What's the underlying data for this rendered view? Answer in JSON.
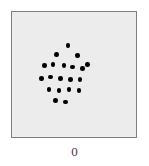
{
  "figure": {
    "width": 149,
    "height": 166,
    "background_color": "#ffffff"
  },
  "panel": {
    "fill_color": "#ececec",
    "border_color": "#7f7f7f",
    "border_width_px": 1,
    "left_px": 11,
    "top_px": 11,
    "width_px": 126,
    "height_px": 127
  },
  "axis": {
    "x_label": "0"
  },
  "chart_data": {
    "type": "scatter",
    "title": "",
    "subtitle": "",
    "xlabel": "0",
    "ylabel": "",
    "xlim": [
      0,
      100
    ],
    "ylim": [
      0,
      100
    ],
    "grid": false,
    "legend": null,
    "annotations": [],
    "tick_labels": {
      "x": [],
      "y": []
    },
    "marker": {
      "shape": "circle",
      "color": "#000000",
      "size_px": 4.6
    },
    "n_points": 20,
    "series": [
      {
        "name": "cluster",
        "color": "#000000",
        "x": [
          45,
          36,
          53,
          61,
          26,
          33,
          42,
          49,
          57,
          24,
          31,
          39,
          47,
          55,
          30,
          38,
          46,
          54,
          35,
          43
        ],
        "y": [
          73,
          66,
          65,
          58,
          57,
          58,
          57,
          56,
          55,
          47,
          48,
          47,
          46,
          46,
          38,
          37,
          38,
          37,
          29,
          28
        ]
      }
    ]
  }
}
